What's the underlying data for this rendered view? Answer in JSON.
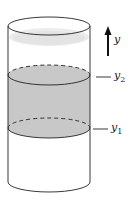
{
  "diagram": {
    "axis_label": "y",
    "levels": [
      {
        "name": "y2",
        "symbol": "y",
        "subscript": "2"
      },
      {
        "name": "y1",
        "symbol": "y",
        "subscript": "1"
      }
    ],
    "colors": {
      "outline": "#222222",
      "shaded_band": "#c8c8c8",
      "top_surface": "#e6e6e6",
      "background": "#ffffff"
    }
  }
}
